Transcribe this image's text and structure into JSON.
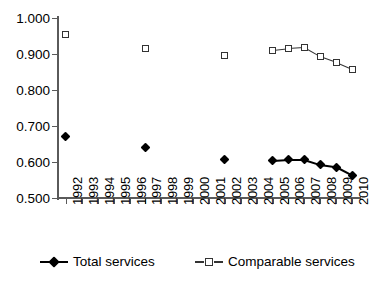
{
  "chart_data": {
    "type": "line",
    "title": "",
    "subtitle": "",
    "xlabel": "",
    "ylabel": "",
    "grid": false,
    "legend_position": "bottom",
    "ylim": [
      0.5,
      1.0
    ],
    "ytick_labels": [
      "1.000",
      "0.900",
      "0.800",
      "0.700",
      "0.600",
      "0.500"
    ],
    "ytick_values": [
      1.0,
      0.9,
      0.8,
      0.7,
      0.6,
      0.5
    ],
    "categories": [
      "1992",
      "1993",
      "1994",
      "1995",
      "1996",
      "1997",
      "1998",
      "1999",
      "2000",
      "2001",
      "2002",
      "2003",
      "2004",
      "2005",
      "2006",
      "2007",
      "2008",
      "2009",
      "2010"
    ],
    "series": [
      {
        "name": "Total services",
        "marker": "filled-diamond",
        "color": "#000000",
        "values": [
          0.672,
          null,
          null,
          null,
          null,
          0.639,
          null,
          null,
          null,
          null,
          0.606,
          null,
          null,
          0.603,
          0.606,
          0.606,
          0.592,
          0.586,
          0.563
        ]
      },
      {
        "name": "Comparable services",
        "marker": "open-square",
        "color": "#333333",
        "values": [
          0.954,
          null,
          null,
          null,
          null,
          0.916,
          null,
          null,
          null,
          null,
          0.895,
          null,
          null,
          0.91,
          0.915,
          0.918,
          0.893,
          0.877,
          0.858
        ]
      }
    ],
    "annotations": []
  },
  "legend": {
    "items": [
      {
        "label": "Total services",
        "marker": "filled-diamond-icon"
      },
      {
        "label": "Comparable services",
        "marker": "open-square-icon"
      }
    ]
  }
}
